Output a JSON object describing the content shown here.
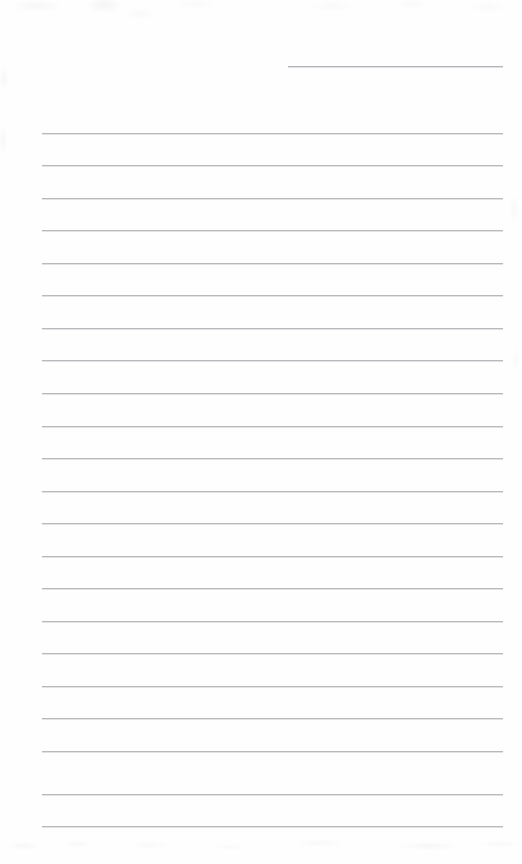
{
  "document": {
    "type": "lined-paper",
    "title": "Blank ruled writing paper",
    "page_width": 522,
    "page_height": 864,
    "background_color": "#fefefe",
    "rule_color": "#b7b9bd",
    "header_rule_color": "#b2b4b9",
    "text_content": "",
    "is_blank": true
  },
  "header_rule": {
    "name": "top-right-entry-line",
    "value": "",
    "x": 288,
    "y": 66,
    "width": 215
  },
  "body_rules": {
    "left": 42,
    "right": 503,
    "width": 461,
    "first_y": 132.5,
    "spacing": 32.55,
    "count": 22,
    "y_positions": [
      132.5,
      165.1,
      197.6,
      230.2,
      262.7,
      295.3,
      327.8,
      360.4,
      392.9,
      425.5,
      458.0,
      490.6,
      523.1,
      555.7,
      588.2,
      620.8,
      653.3,
      685.9,
      718.4,
      751.0,
      793.5,
      826.0
    ]
  }
}
